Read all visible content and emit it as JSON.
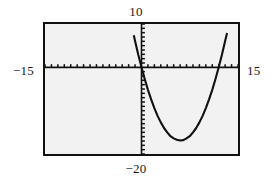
{
  "app": {
    "kind": "graphing-calculator-viewport",
    "background_color": "#ffffff",
    "screen_color": "#f2f2f2",
    "frame_color": "#111111",
    "ink_color": "#111111"
  },
  "labels": {
    "ymax": "10",
    "ymin": "−20",
    "xmin": "−15",
    "xmax": "15"
  },
  "chart_data": {
    "type": "line",
    "title": "",
    "xlabel": "",
    "ylabel": "",
    "xlim": [
      -15,
      15
    ],
    "ylim": [
      -20,
      10
    ],
    "grid": false,
    "legend": "none",
    "axes": {
      "x_axis_y": 0,
      "y_axis_x": 0,
      "x_tick_step": 1,
      "y_tick_step": 1,
      "tick_style": "hash-marks-on-axes"
    },
    "annotations": [
      "window x from -15 to 15",
      "window y from -20 to 10",
      "parabola opens upward",
      "vertex near (5.5, -17)",
      "x-intercepts near 0 and 12"
    ],
    "series": [
      {
        "name": "parabola",
        "equation": "y = (x)(x - 12) * 0.47",
        "x": [
          -1.2,
          -1.0,
          -0.5,
          0.0,
          0.5,
          1.0,
          1.5,
          2.0,
          2.5,
          3.0,
          3.5,
          4.0,
          4.5,
          5.0,
          5.5,
          6.0,
          6.5,
          7.0,
          7.5,
          8.0,
          8.5,
          9.0,
          9.5,
          10.0,
          10.5,
          11.0,
          11.5,
          12.0,
          12.5,
          13.0,
          13.3
        ],
        "y": [
          7.4,
          6.1,
          2.9,
          0.0,
          -2.7,
          -5.2,
          -7.4,
          -9.4,
          -11.2,
          -12.7,
          -14.0,
          -15.0,
          -15.9,
          -16.4,
          -16.7,
          -16.9,
          -16.8,
          -16.4,
          -15.9,
          -15.0,
          -14.0,
          -12.7,
          -11.2,
          -9.4,
          -7.4,
          -5.2,
          -2.7,
          0.0,
          2.9,
          6.1,
          7.9
        ]
      }
    ]
  }
}
